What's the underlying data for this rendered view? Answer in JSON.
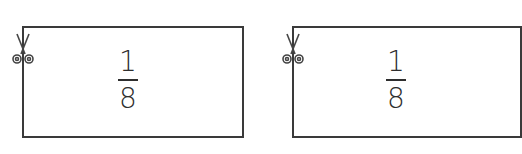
{
  "cards": [
    {
      "numerator": "1",
      "denominator": "8",
      "icon": "scissors-icon"
    },
    {
      "numerator": "1",
      "denominator": "8",
      "icon": "scissors-icon"
    }
  ]
}
